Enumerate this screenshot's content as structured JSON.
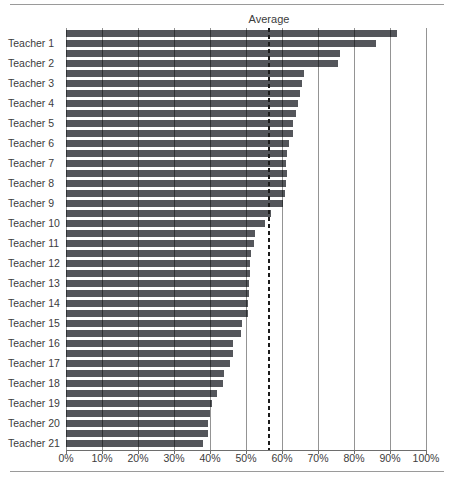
{
  "labels": {
    "average": "Average"
  },
  "chart_data": {
    "type": "bar",
    "orientation": "horizontal",
    "title": "",
    "xlabel": "",
    "ylabel": "",
    "xlim": [
      0,
      100
    ],
    "grid": true,
    "legend_position": "none",
    "average_line": 56.5,
    "average_label": "Average",
    "bar_color": "#54565b",
    "tick_labels": [
      "0%",
      "10%",
      "20%",
      "30%",
      "40%",
      "50%",
      "60%",
      "70%",
      "80%",
      "90%",
      "100%"
    ],
    "tick_values": [
      0,
      10,
      20,
      30,
      40,
      50,
      60,
      70,
      80,
      90,
      100
    ],
    "categories": [
      "Teacher 1",
      "Teacher 2",
      "Teacher 3",
      "Teacher 4",
      "Teacher 5",
      "Teacher 6",
      "Teacher 7",
      "Teacher 8",
      "Teacher 9",
      "Teacher 10",
      "Teacher 11",
      "Teacher 12",
      "Teacher 13",
      "Teacher 14",
      "Teacher 15",
      "Teacher 16",
      "Teacher 17",
      "Teacher 18",
      "Teacher 19",
      "Teacher 20",
      "Teacher 21"
    ],
    "series": [
      {
        "name": "bar-1",
        "values": [
          92,
          76,
          66,
          65,
          64,
          63,
          61.5,
          61.5,
          60.7,
          57,
          52.5,
          51.5,
          51,
          50.8,
          50.5,
          48.5,
          46.5,
          44,
          42,
          40,
          39.5
        ]
      },
      {
        "name": "bar-2",
        "values": [
          86,
          75.5,
          65.5,
          64.5,
          63,
          62,
          61,
          61,
          60.3,
          55.3,
          52.2,
          51.2,
          50.8,
          50.6,
          49,
          46.5,
          45.5,
          43.5,
          40.5,
          39.5,
          38
        ]
      }
    ]
  }
}
